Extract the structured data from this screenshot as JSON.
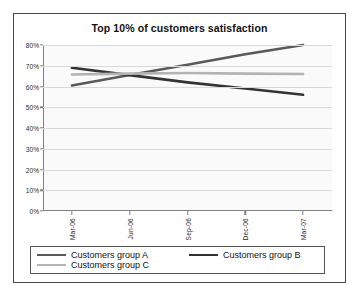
{
  "chart_data": {
    "type": "line",
    "title": "Top 10% of customers satisfaction",
    "xlabel": "",
    "ylabel": "",
    "categories": [
      "Mar-06",
      "Jun-06",
      "Sep-06",
      "Dec-06",
      "Mar-07"
    ],
    "ylim": [
      0,
      80
    ],
    "ytick_labels": [
      "80%",
      "70%",
      "60%",
      "50%",
      "40%",
      "30%",
      "20%",
      "10%",
      "0%"
    ],
    "ytick_values": [
      80,
      70,
      60,
      50,
      40,
      30,
      20,
      10,
      0
    ],
    "grid": true,
    "legend_position": "bottom",
    "series": [
      {
        "name": "Customers group A",
        "color": "#5a5a5a",
        "values": [
          60.5,
          65.5,
          70.5,
          75.5,
          80.0
        ]
      },
      {
        "name": "Customers group B",
        "color": "#333333",
        "values": [
          69.0,
          65.5,
          62.0,
          59.0,
          56.0
        ]
      },
      {
        "name": "Customers group C",
        "color": "#b3b3b3",
        "values": [
          65.8,
          66.2,
          66.5,
          66.2,
          66.0
        ]
      }
    ]
  },
  "legend": {
    "items": [
      {
        "label": "Customers group A",
        "color": "#5a5a5a"
      },
      {
        "label": "Customers group B",
        "color": "#333333"
      },
      {
        "label": "Customers group C",
        "color": "#b3b3b3"
      }
    ]
  }
}
